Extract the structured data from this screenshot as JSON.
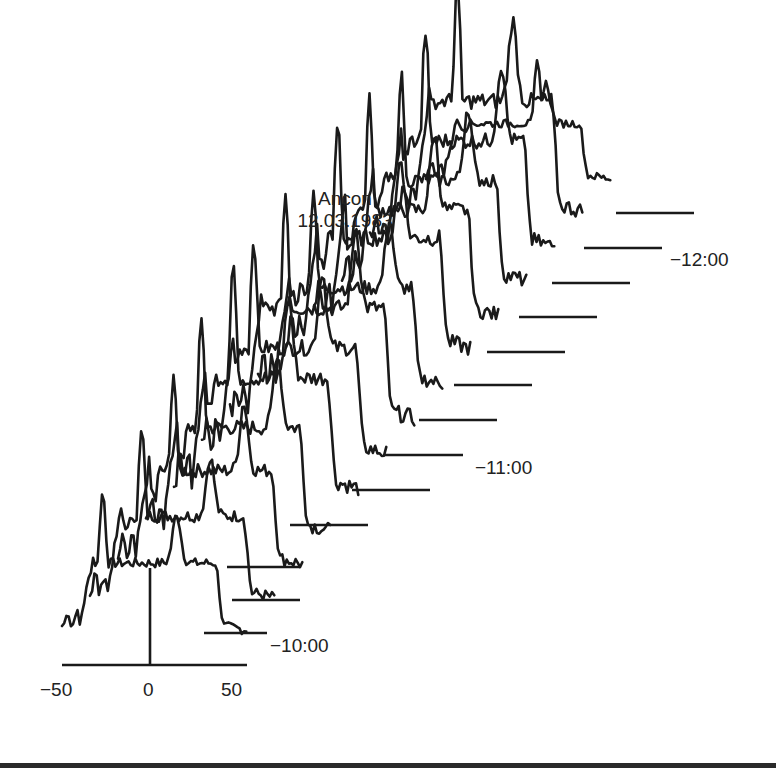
{
  "chart_data": {
    "type": "line",
    "subtype": "waterfall (stacked time-series profiles, diagonally offset)",
    "title": "Ancon",
    "subtitle": "12.03.1983",
    "x_axis": {
      "ticks": [
        -50,
        0,
        50
      ],
      "tick_labels": [
        "−50",
        "0",
        "50"
      ],
      "range": [
        -50,
        50
      ],
      "center_marker": 0,
      "xlabel": ""
    },
    "y_axis": {
      "ylabel": "",
      "ticks": []
    },
    "time_markers": [
      {
        "label": "−10:00",
        "trace_index": 1
      },
      {
        "label": "−11:00",
        "trace_index": 6
      },
      {
        "label": "−12:00",
        "trace_index": 12
      }
    ],
    "n_traces": 14,
    "traces": [
      {
        "index": 0,
        "baseline_y": 665,
        "x_start": 62,
        "x_end": 247,
        "peak_height": 140,
        "peak_x": -28
      },
      {
        "index": 1,
        "baseline_y": 633,
        "x_start": 90,
        "x_end": 267,
        "peak_height": 170,
        "peak_x": -22
      },
      {
        "index": 2,
        "baseline_y": 600,
        "x_start": 118,
        "x_end": 300,
        "peak_height": 195,
        "peak_x": -20
      },
      {
        "index": 3,
        "baseline_y": 567,
        "x_start": 146,
        "x_end": 300,
        "peak_height": 215,
        "peak_x": -20
      },
      {
        "index": 4,
        "baseline_y": 525,
        "x_start": 174,
        "x_end": 368,
        "peak_height": 230,
        "peak_x": -18
      },
      {
        "index": 5,
        "baseline_y": 490,
        "x_start": 202,
        "x_end": 430,
        "peak_height": 220,
        "peak_x": -22
      },
      {
        "index": 6,
        "baseline_y": 455,
        "x_start": 230,
        "x_end": 463,
        "peak_height": 230,
        "peak_x": -20
      },
      {
        "index": 7,
        "baseline_y": 420,
        "x_start": 258,
        "x_end": 497,
        "peak_height": 200,
        "peak_x": -20
      },
      {
        "index": 8,
        "baseline_y": 385,
        "x_start": 286,
        "x_end": 532,
        "peak_height": 230,
        "peak_x": -22
      },
      {
        "index": 9,
        "baseline_y": 352,
        "x_start": 314,
        "x_end": 565,
        "peak_height": 220,
        "peak_x": -20
      },
      {
        "index": 10,
        "baseline_y": 317,
        "x_start": 342,
        "x_end": 597,
        "peak_height": 210,
        "peak_x": -18
      },
      {
        "index": 11,
        "baseline_y": 283,
        "x_start": 370,
        "x_end": 630,
        "peak_height": 220,
        "peak_x": -20
      },
      {
        "index": 12,
        "baseline_y": 248,
        "x_start": 398,
        "x_end": 662,
        "peak_height": 230,
        "peak_x": -18
      },
      {
        "index": 13,
        "baseline_y": 213,
        "x_start": 426,
        "x_end": 694,
        "peak_height": 115,
        "peak_x": 10
      }
    ],
    "grid": false,
    "legend": null
  },
  "labels": {
    "title_line1": "Ancon",
    "title_line2": "12.03.1983",
    "tick_minus50": "−50",
    "tick_0": "0",
    "tick_50": "50",
    "time_10": "−10:00",
    "time_11": "−11:00",
    "time_12": "−12:00"
  },
  "colors": {
    "ink": "#1a1a1a",
    "background": "#ffffff"
  }
}
